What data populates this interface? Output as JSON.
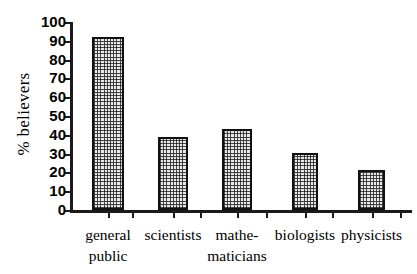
{
  "chart_data": {
    "type": "bar",
    "title": "",
    "subtitle": "",
    "xlabel": "",
    "ylabel": "% believers",
    "categories": [
      "general public",
      "scientists",
      "mathe-maticians",
      "biologists",
      "physicists"
    ],
    "category_lines": [
      [
        "general",
        "public"
      ],
      [
        "scientists",
        ""
      ],
      [
        "mathe-",
        "maticians"
      ],
      [
        "biologists",
        ""
      ],
      [
        "physicists",
        ""
      ]
    ],
    "values": [
      92,
      39,
      43,
      30.5,
      21.5
    ],
    "ylim": [
      0,
      100
    ],
    "ytick_step": 10,
    "yticks": [
      0,
      10,
      20,
      30,
      40,
      50,
      60,
      70,
      80,
      90,
      100
    ],
    "ytick_labels": [
      "0",
      "10",
      "20",
      "30",
      "40",
      "50",
      "60",
      "70",
      "80",
      "90",
      "100"
    ],
    "grid": false,
    "legend": null,
    "legend_position": "none",
    "bar_fill": "cross-hatch",
    "bar_edge_color": "#111111",
    "bar_face_color": "#e8e8e8",
    "axis_color": "#1a1a1a"
  }
}
